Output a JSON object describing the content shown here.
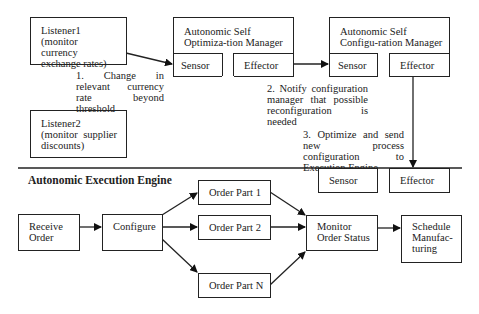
{
  "listeners": [
    {
      "label": "Listener1 (monitor currency exchange rates)"
    },
    {
      "label": "Listener2 (monitor supplier discounts)"
    }
  ],
  "optimization_manager": {
    "title": "Autonomic Self Optimiza-tion Manager",
    "sensor": "Sensor",
    "effector": "Effector"
  },
  "configuration_manager": {
    "title": "Autonomic Self Configu-ration Manager",
    "sensor": "Sensor",
    "effector": "Effector"
  },
  "annotations": {
    "step1": "1. Change in relevant currency rate beyond threshold",
    "step2": "2. Notify configuration manager that possible reconfiguration is needed",
    "step3": "3. Optimize and send new process configuration to Execution Engine"
  },
  "execution_engine": {
    "title": "Autonomic Execution Engine",
    "sensor": "Sensor",
    "effector": "Effector",
    "nodes": {
      "receive": "Receive Order",
      "configure": "Configure",
      "part1": "Order Part 1",
      "part2": "Order Part 2",
      "partN": "Order Part N",
      "monitor": "Monitor Order Status",
      "schedule": "Schedule Manufac-turing"
    }
  }
}
